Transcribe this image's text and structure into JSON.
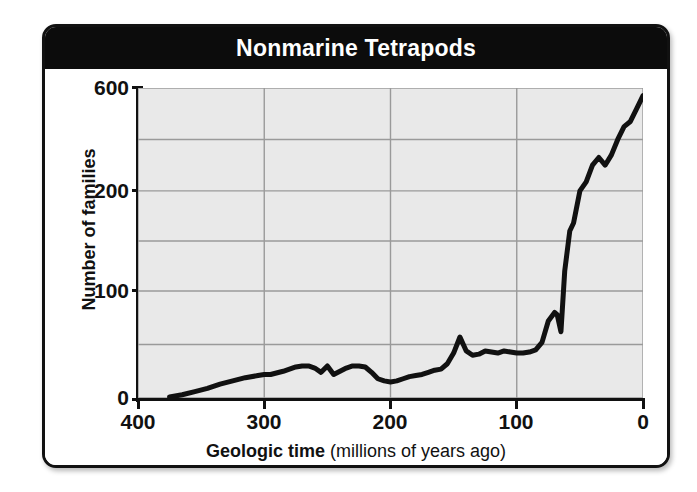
{
  "chart_title": "Nonmarine Tetrapods",
  "axes": {
    "y_title": "Number of families",
    "x_title_main": "Geologic time",
    "x_title_sub": "(millions of years ago)",
    "y_ticks": [
      "600",
      "200",
      "100",
      "0"
    ],
    "x_ticks": [
      "400",
      "300",
      "200",
      "100",
      "0"
    ]
  },
  "chart_data": {
    "type": "line",
    "title": "Nonmarine Tetrapods",
    "xlabel": "Geologic time (millions of years ago)",
    "ylabel": "Number of families",
    "xlim": [
      400,
      0
    ],
    "ylim": [
      0,
      600
    ],
    "x_reversed": true,
    "y_scale": "nonlinear (compressed above 200)",
    "y_tick_values": [
      0,
      100,
      200,
      600
    ],
    "x_tick_values": [
      400,
      300,
      200,
      100,
      0
    ],
    "grid": true,
    "legend": "none",
    "line_color": "#111111",
    "plot_background": "#e9e9e9",
    "grid_color": "#9a9a9a",
    "series": [
      {
        "name": "Nonmarine tetrapod families",
        "x": [
          375,
          365,
          355,
          345,
          335,
          325,
          315,
          305,
          300,
          295,
          285,
          275,
          270,
          265,
          260,
          255,
          250,
          245,
          240,
          235,
          230,
          225,
          220,
          215,
          210,
          205,
          200,
          195,
          190,
          185,
          180,
          175,
          170,
          165,
          160,
          155,
          150,
          145,
          140,
          135,
          130,
          125,
          120,
          115,
          110,
          105,
          100,
          95,
          90,
          85,
          80,
          75,
          70,
          68,
          65,
          62,
          58,
          55,
          50,
          45,
          40,
          35,
          30,
          25,
          20,
          15,
          10,
          5,
          0
        ],
        "y": [
          1,
          3,
          6,
          9,
          13,
          16,
          19,
          21,
          22,
          22,
          25,
          29,
          30,
          30,
          28,
          24,
          30,
          22,
          25,
          28,
          30,
          30,
          29,
          24,
          18,
          16,
          15,
          16,
          18,
          20,
          21,
          22,
          24,
          26,
          27,
          32,
          42,
          57,
          44,
          40,
          41,
          44,
          43,
          42,
          44,
          43,
          42,
          42,
          43,
          45,
          52,
          72,
          80,
          78,
          62,
          120,
          160,
          168,
          200,
          235,
          300,
          330,
          300,
          340,
          400,
          450,
          470,
          520,
          570
        ]
      }
    ],
    "annotations": []
  }
}
